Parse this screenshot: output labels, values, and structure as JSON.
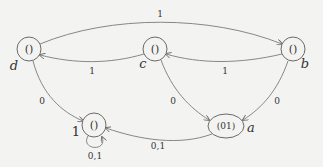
{
  "diagram": {
    "type": "state-transition-graph",
    "nodes": [
      {
        "id": "d",
        "name": "d",
        "content": "()",
        "x": 29,
        "y": 49
      },
      {
        "id": "c",
        "name": "c",
        "content": "()",
        "x": 155,
        "y": 49
      },
      {
        "id": "b",
        "name": "b",
        "content": "()",
        "x": 293,
        "y": 49
      },
      {
        "id": "a",
        "name": "a",
        "content": "(01)",
        "x": 226,
        "y": 126
      },
      {
        "id": "one",
        "name": "1",
        "content": "()",
        "x": 94,
        "y": 125
      }
    ],
    "edges": [
      {
        "from": "d",
        "to": "b",
        "label": "1"
      },
      {
        "from": "c",
        "to": "d",
        "label": "1"
      },
      {
        "from": "b",
        "to": "c",
        "label": "1"
      },
      {
        "from": "d",
        "to": "one",
        "label": "0"
      },
      {
        "from": "c",
        "to": "a",
        "label": "0"
      },
      {
        "from": "b",
        "to": "a",
        "label": "0"
      },
      {
        "from": "a",
        "to": "one",
        "label": "0,1"
      },
      {
        "from": "one",
        "to": "one",
        "label": "0,1"
      }
    ]
  }
}
